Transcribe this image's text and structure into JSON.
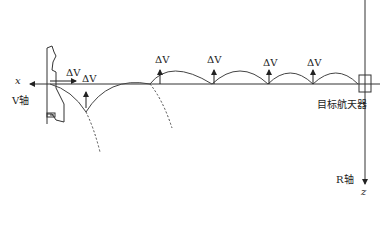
{
  "diagram": {
    "type": "v-bar hopping rendezvous trajectory",
    "axes": {
      "v_axis": {
        "symbol": "x",
        "label": "V轴"
      },
      "r_axis": {
        "symbol": "z",
        "label": "R轴"
      }
    },
    "target_label": "目标航天器",
    "impulse_label": "ΔV",
    "impulse_count": 6,
    "colors": {
      "line": "#333333",
      "background": "#ffffff"
    }
  }
}
